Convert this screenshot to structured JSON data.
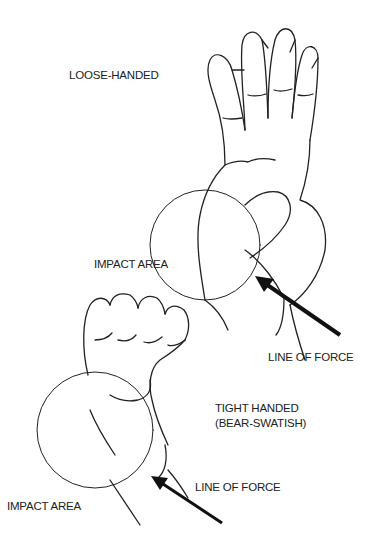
{
  "diagram": {
    "top": {
      "title": "LOOSE-HANDED",
      "impact_label": "IMPACT AREA",
      "force_label": "LINE OF FORCE"
    },
    "bottom": {
      "title_line1": "TIGHT HANDED",
      "title_line2": "(BEAR-SWATISH)",
      "impact_label": "IMPACT AREA",
      "force_label": "LINE OF FORCE"
    }
  }
}
